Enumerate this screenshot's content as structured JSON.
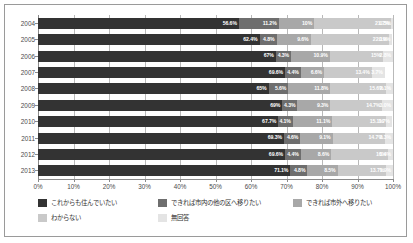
{
  "chart_data": {
    "type": "bar",
    "orientation": "horizontal",
    "stacked": true,
    "stack_mode": "percent",
    "title": "",
    "subtitle": "",
    "xlabel": "",
    "ylabel": "",
    "xlim": [
      0,
      100
    ],
    "grid": true,
    "legend_position": "bottom",
    "categories": [
      "2004",
      "2005",
      "2006",
      "2007",
      "2008",
      "2009",
      "2010",
      "2011",
      "2012",
      "2013"
    ],
    "xticks": [
      "0%",
      "10%",
      "20%",
      "30%",
      "40%",
      "50%",
      "60%",
      "70%",
      "80%",
      "90%",
      "100%"
    ],
    "xtick_values": [
      0,
      10,
      20,
      30,
      40,
      50,
      60,
      70,
      80,
      90,
      100
    ],
    "series": [
      {
        "name": "これからも住んでいたい",
        "color": "#333333",
        "values": [
          56.6,
          62.4,
          67,
          69.6,
          65,
          69,
          67.7,
          69.3,
          69.6,
          71.1
        ],
        "labels": [
          "56.6%",
          "62.4%",
          "67%",
          "69.6%",
          "65%",
          "69%",
          "67.7%",
          "69.3%",
          "69.6%",
          "71.1%"
        ]
      },
      {
        "name": "できれば市内の他の区へ移りたい",
        "color": "#6e6e6e",
        "values": [
          11.2,
          4.8,
          4.3,
          4.4,
          5.6,
          4.3,
          4.1,
          4.6,
          4.4,
          4.8
        ],
        "labels": [
          "11.2%",
          "4.8%",
          "4.3%",
          "4.4%",
          "5.6%",
          "4.3%",
          "4.1%",
          "4.6%",
          "4.4%",
          "4.8%"
        ]
      },
      {
        "name": "できれば市外へ移りたい",
        "color": "#a8a8a8",
        "values": [
          10,
          9.6,
          10.9,
          6.6,
          11.8,
          9.3,
          11.1,
          9.1,
          8.6,
          8.5
        ],
        "labels": [
          "10%",
          "9.6%",
          "10.9%",
          "6.6%",
          "11.8%",
          "9.3%",
          "11.1%",
          "9.1%",
          "8.6%",
          "8.5%"
        ]
      },
      {
        "name": "わからない",
        "color": "#c9c9c9",
        "values": [
          21.7,
          22.1,
          15,
          13.4,
          15.6,
          14.7,
          15.1,
          14.7,
          16,
          13.7
        ],
        "labels": [
          "21.7%",
          "22.1%",
          "15%",
          "13.4%",
          "15.6%",
          "14.7%",
          "15.1%",
          "14.7%",
          "16%",
          "13.7%"
        ]
      },
      {
        "name": "無回答",
        "color": "#e4e4e4",
        "values": [
          0.5,
          0.9,
          2.8,
          3.7,
          2.1,
          3.0,
          1.7,
          2.3,
          1.4,
          1.9
        ],
        "labels": [
          "0.5%",
          "0.9%",
          "2.8%",
          "3.7%",
          "2.1%",
          "3.0%",
          "1.7%",
          "2.3%",
          "1.4%",
          "1.9%"
        ]
      }
    ]
  }
}
